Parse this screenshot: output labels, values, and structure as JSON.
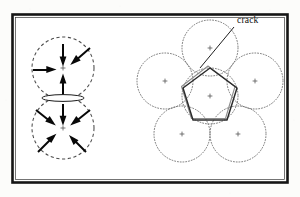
{
  "figure": {
    "background_color": "#fcfcfa",
    "frame_color": "#151515",
    "ink_color": "#080808",
    "width": 300,
    "height": 197
  },
  "annotations": {
    "crack_label": "crack",
    "crack_label_x": 237,
    "crack_label_y": 22,
    "leader_from": [
      234,
      26
    ],
    "leader_to": [
      200,
      67
    ]
  },
  "left_panel": {
    "name": "two-grain contact diagram",
    "description": "two dashed circles in contact with inward force arrows and a lens-shaped crack at the contact",
    "circles": [
      {
        "id": "upper-grain",
        "cx": 63,
        "cy": 68,
        "r": 31,
        "style": "dashed"
      },
      {
        "id": "lower-grain",
        "cx": 63,
        "cy": 128,
        "r": 31,
        "style": "dashed"
      }
    ],
    "crack": {
      "cx": 63,
      "cy": 98,
      "rx": 21,
      "ry": 3.4
    },
    "upper_arrows": [
      {
        "angle_deg": 270,
        "label": "from-top"
      },
      {
        "angle_deg": 325,
        "label": "from-upper-right"
      },
      {
        "angle_deg": 180,
        "label": "from-left"
      },
      {
        "angle_deg": 90,
        "label": "from-bottom"
      }
    ],
    "lower_arrows": [
      {
        "angle_deg": 270,
        "label": "from-top"
      },
      {
        "angle_deg": 320,
        "label": "from-upper-right"
      },
      {
        "angle_deg": 210,
        "label": "from-upper-left"
      },
      {
        "angle_deg": 145,
        "label": "from-lower-left"
      },
      {
        "angle_deg": 60,
        "label": "from-lower-right"
      }
    ]
  },
  "right_panel": {
    "name": "pentagonal grain packing diagram",
    "description": "a central grain surrounded by five neighbouring grains with a pentagonal crack outline",
    "center_circle": {
      "id": "central-grain",
      "cx": 210,
      "cy": 96,
      "r": 28,
      "style": "dotted"
    },
    "ring_circles": [
      {
        "id": "neighbour-top",
        "cx": 210,
        "cy": 48,
        "r": 28,
        "style": "dotted"
      },
      {
        "id": "neighbour-upper-right",
        "cx": 255,
        "cy": 81,
        "r": 28,
        "style": "dotted"
      },
      {
        "id": "neighbour-lower-right",
        "cx": 238,
        "cy": 134,
        "r": 28,
        "style": "dotted"
      },
      {
        "id": "neighbour-lower-left",
        "cx": 182,
        "cy": 134,
        "r": 28,
        "style": "dotted"
      },
      {
        "id": "neighbour-upper-left",
        "cx": 165,
        "cy": 81,
        "r": 28,
        "style": "dotted"
      }
    ],
    "pentagon_vertices": [
      [
        210,
        68
      ],
      [
        237,
        88
      ],
      [
        227,
        120
      ],
      [
        193,
        120
      ],
      [
        183,
        88
      ]
    ]
  }
}
